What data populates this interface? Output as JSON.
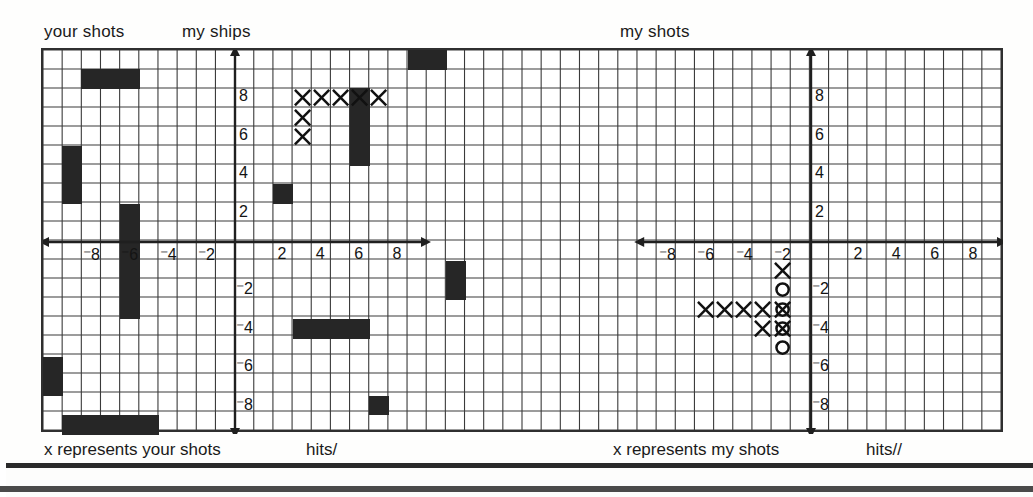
{
  "page": {
    "bg_color": "#fefefd",
    "ink_color": "#262626",
    "border_color": "#2f2f2f"
  },
  "headers": {
    "your_shots": "your shots",
    "my_ships": "my ships",
    "my_shots": "my shots"
  },
  "captions": {
    "left": "x represents your shots",
    "left_hits": "hits/",
    "right": "x represents my shots",
    "right_hits": "hits//"
  },
  "grid": {
    "cell_px": 19.2,
    "cols": 50,
    "rows": 20,
    "origin_left_px": 41,
    "origin_top_px": 48,
    "line_color": "#3a3a3a"
  },
  "chart_data": {
    "type": "scatter",
    "xlabel": "",
    "ylabel": "",
    "grid": true,
    "panels": [
      {
        "name": "left-panel",
        "header_left": "your shots",
        "header_right": "my ships",
        "caption": "x represents your shots",
        "hits": "hits/",
        "xlim": [
          -10,
          10
        ],
        "ylim": [
          -10,
          10
        ],
        "xticks": [
          -8,
          -6,
          -4,
          -2,
          2,
          4,
          6,
          8
        ],
        "yticks": [
          8,
          6,
          4,
          2,
          -2,
          -4,
          -6,
          -8
        ],
        "xtick_labels": [
          "⁻8",
          "⁻6",
          "⁻4",
          "⁻2",
          "2",
          "4",
          "6",
          "8"
        ],
        "ytick_labels": [
          "8",
          "6",
          "4",
          "2",
          "⁻2",
          "⁻4",
          "⁻6",
          "⁻8"
        ],
        "ships": [
          {
            "cells": [
              [
                -8,
                9
              ],
              [
                -7,
                9
              ],
              [
                -6,
                9
              ]
            ],
            "orientation": "horizontal",
            "length": 3
          },
          {
            "cells": [
              [
                -9,
                5
              ],
              [
                -9,
                4
              ],
              [
                -9,
                3
              ]
            ],
            "orientation": "vertical",
            "length": 3
          },
          {
            "cells": [
              [
                -6,
                2
              ],
              [
                -6,
                1
              ],
              [
                -6,
                0
              ],
              [
                -6,
                -1
              ],
              [
                -6,
                -2
              ],
              [
                -6,
                -3
              ]
            ],
            "orientation": "vertical",
            "length": 6
          },
          {
            "cells": [
              [
                -10,
                -6
              ],
              [
                -10,
                -7
              ]
            ],
            "orientation": "vertical",
            "length": 2
          },
          {
            "cells": [
              [
                -9,
                -9
              ],
              [
                -8,
                -9
              ],
              [
                -7,
                -9
              ],
              [
                -6,
                -9
              ],
              [
                -5,
                -9
              ]
            ],
            "orientation": "horizontal",
            "length": 5
          },
          {
            "cells": [
              [
                2,
                3
              ]
            ],
            "orientation": "single",
            "length": 1
          },
          {
            "cells": [
              [
                6,
                8
              ],
              [
                6,
                7
              ],
              [
                6,
                6
              ],
              [
                6,
                5
              ]
            ],
            "orientation": "vertical",
            "length": 4
          },
          {
            "cells": [
              [
                9,
                10
              ],
              [
                10,
                10
              ]
            ],
            "orientation": "horizontal",
            "length": 2
          },
          {
            "cells": [
              [
                11,
                -1
              ],
              [
                11,
                -2
              ]
            ],
            "orientation": "vertical",
            "length": 2
          },
          {
            "cells": [
              [
                3,
                -4
              ],
              [
                4,
                -4
              ],
              [
                5,
                -4
              ],
              [
                6,
                -4
              ]
            ],
            "orientation": "horizontal",
            "length": 4
          },
          {
            "cells": [
              [
                7,
                -8
              ]
            ],
            "orientation": "single",
            "length": 1
          }
        ],
        "shot_marks": [
          {
            "symbol": "x",
            "x": 3,
            "y": 8
          },
          {
            "symbol": "x",
            "x": 4,
            "y": 8
          },
          {
            "symbol": "x",
            "x": 5,
            "y": 8
          },
          {
            "symbol": "x",
            "x": 6,
            "y": 8
          },
          {
            "symbol": "x",
            "x": 7,
            "y": 8
          },
          {
            "symbol": "x",
            "x": 3,
            "y": 7
          },
          {
            "symbol": "x",
            "x": 3,
            "y": 6
          }
        ]
      },
      {
        "name": "right-panel",
        "header": "my shots",
        "caption": "x represents my shots",
        "hits": "hits//",
        "xlim": [
          -10,
          10
        ],
        "ylim": [
          -10,
          10
        ],
        "xticks": [
          -8,
          -6,
          -4,
          -2,
          2,
          4,
          6,
          8
        ],
        "yticks": [
          8,
          6,
          4,
          2,
          -2,
          -4,
          -6,
          -8
        ],
        "xtick_labels": [
          "⁻8",
          "⁻6",
          "⁻4",
          "⁻2",
          "2",
          "4",
          "6",
          "8"
        ],
        "ytick_labels": [
          "8",
          "6",
          "4",
          "2",
          "⁻2",
          "⁻4",
          "⁻6",
          "⁻8"
        ],
        "ships": [],
        "shot_marks": [
          {
            "symbol": "x",
            "x": -2,
            "y": -1
          },
          {
            "symbol": "x",
            "x": -6,
            "y": -3
          },
          {
            "symbol": "x",
            "x": -5,
            "y": -3
          },
          {
            "symbol": "x",
            "x": -4,
            "y": -3
          },
          {
            "symbol": "x",
            "x": -3,
            "y": -3
          },
          {
            "symbol": "x",
            "x": -2,
            "y": -3
          },
          {
            "symbol": "x",
            "x": -3,
            "y": -4
          },
          {
            "symbol": "x",
            "x": -2,
            "y": -4
          },
          {
            "symbol": "o",
            "x": -2,
            "y": -2
          },
          {
            "symbol": "o",
            "x": -2,
            "y": -3
          },
          {
            "symbol": "o",
            "x": -2,
            "y": -4
          },
          {
            "symbol": "o",
            "x": -2,
            "y": -5
          }
        ]
      }
    ]
  }
}
